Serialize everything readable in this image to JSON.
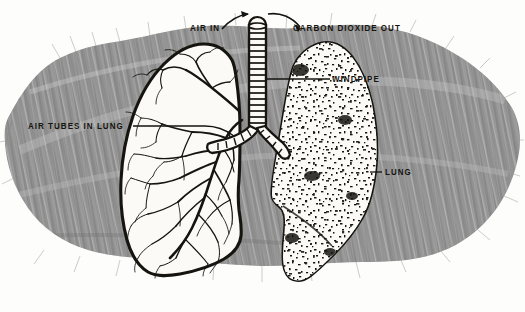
{
  "figure": {
    "style": "vintage-textbook-pen-and-ink-illustration",
    "background_color": "#8c8c8c",
    "ink_color": "#15140f",
    "paper_color": "#fdfdfc",
    "lung_fill_color": "#fbfaf6"
  },
  "labels": {
    "air_in": "AIR IN",
    "carbon_dioxide_out": "CARBON DIOXIDE OUT",
    "windpipe": "WINDPIPE",
    "lung": "LUNG",
    "air_tubes_in_lung": "AIR TUBES IN LUNG"
  },
  "annotations": {
    "arrow_in": "curved-arrow-pointing-into-windpipe",
    "arrow_out": "curved-arrow-pointing-away-from-windpipe",
    "leader_windpipe": "leader-line-from-windpipe-to-label",
    "leader_lung": "leader-line-from-right-lung-to-label",
    "leader_air_tubes": "leader-line-from-left-lung-to-label"
  },
  "parts": {
    "left_lung": "bronchial-tree-cutaway-lung",
    "right_lung": "stippled-texture-lung",
    "trachea": "ringed-windpipe",
    "bronchi": "ringed-branching-bronchi"
  }
}
